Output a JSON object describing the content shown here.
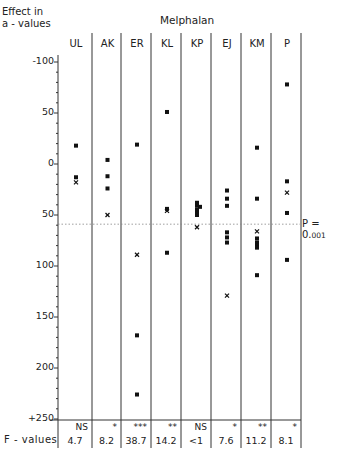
{
  "chart_data": {
    "type": "scatter",
    "title": "Melphalan",
    "ylabel": "Effect in a-values",
    "xlabel": "",
    "ylim": [
      -100,
      250
    ],
    "y_axis_inverted": true,
    "y_ticks": [
      "-100",
      "50",
      "0",
      "50",
      "100",
      "150",
      "200",
      "+250"
    ],
    "categories": [
      "UL",
      "AK",
      "ER",
      "KL",
      "KP",
      "EJ",
      "KM",
      "P"
    ],
    "series": [
      {
        "name": "UL",
        "squares": [
          -18,
          13
        ],
        "crosses": [
          18
        ]
      },
      {
        "name": "AK",
        "squares": [
          -4,
          12,
          24
        ],
        "crosses": [
          50
        ]
      },
      {
        "name": "ER",
        "squares": [
          -19,
          168,
          226
        ],
        "crosses": [
          89
        ]
      },
      {
        "name": "KL",
        "squares": [
          -51,
          44,
          87
        ],
        "crosses": [
          46
        ]
      },
      {
        "name": "KP",
        "squares": [
          38,
          41,
          42,
          45,
          47,
          50
        ],
        "crosses": [
          62
        ]
      },
      {
        "name": "EJ",
        "squares": [
          26,
          34,
          41,
          67,
          72,
          77
        ],
        "crosses": [
          129
        ]
      },
      {
        "name": "KM",
        "squares": [
          -16,
          34,
          73,
          77,
          80,
          82,
          109
        ],
        "crosses": [
          66
        ]
      },
      {
        "name": "P",
        "squares": [
          -78,
          17,
          48,
          94
        ],
        "crosses": [
          28
        ]
      }
    ],
    "reference_line": {
      "value": 59,
      "label": "P = 0.001",
      "style": "dotted"
    },
    "significance": [
      "NS",
      "*",
      "***",
      "**",
      "NS",
      "*",
      "**",
      "*"
    ],
    "f_values": [
      "4.7",
      "8.2",
      "38.7",
      "14.2",
      "<1",
      "7.6",
      "11.2",
      "8.1"
    ],
    "grid": false
  },
  "labels": {
    "ylabel_line1": "Effect in",
    "ylabel_line2": "a - values",
    "title": "Melphalan",
    "f_values_label": "F - values",
    "p_label": "P = 0.",
    "p_small": "001"
  }
}
